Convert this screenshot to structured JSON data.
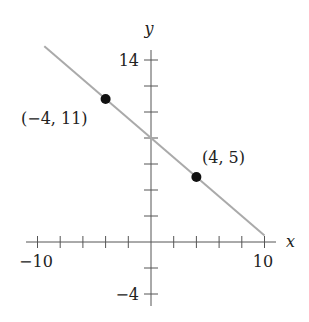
{
  "chart_data": {
    "type": "line",
    "title": "",
    "xlabel": "x",
    "ylabel": "y",
    "xlim": [
      -10,
      10
    ],
    "ylim": [
      -4,
      14
    ],
    "x_tick_labels": [
      "-10",
      "10"
    ],
    "y_tick_labels": [
      "14",
      "-4"
    ],
    "x_ticks": [
      -10,
      -8,
      -6,
      -4,
      -2,
      2,
      4,
      6,
      8,
      10
    ],
    "y_ticks": [
      -4,
      -2,
      2,
      4,
      6,
      8,
      10,
      12,
      14
    ],
    "series": [
      {
        "name": "line",
        "equation": "y = -0.75x + 8",
        "x": [
          -9.4,
          10
        ],
        "y": [
          15.05,
          0.5
        ],
        "color": "#aaaaaa"
      }
    ],
    "points": [
      {
        "x": -4,
        "y": 11,
        "label": "(−4, 11)"
      },
      {
        "x": 4,
        "y": 5,
        "label": "(4, 5)"
      }
    ],
    "grid": false
  },
  "labels": {
    "x_axis": "x",
    "y_axis": "y",
    "x_min": "−10",
    "x_max": "10",
    "y_max": "14",
    "y_min": "−4",
    "point1": "(−4, 11)",
    "point2": "(4, 5)"
  }
}
